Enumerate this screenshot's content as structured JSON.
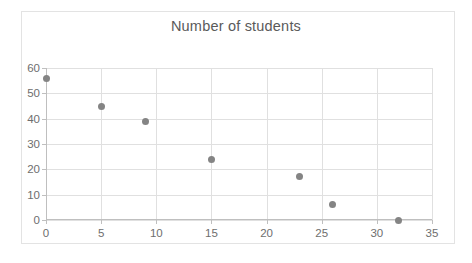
{
  "chart_data": {
    "type": "scatter",
    "title": "Number of students",
    "xlabel": "",
    "ylabel": "",
    "xlim": [
      0,
      35
    ],
    "ylim": [
      0,
      60
    ],
    "xticks": [
      0,
      5,
      10,
      15,
      20,
      25,
      30,
      35
    ],
    "yticks": [
      0,
      10,
      20,
      30,
      40,
      50,
      60
    ],
    "xtick_labels": [
      "0",
      "5",
      "10",
      "15",
      "20",
      "25",
      "30",
      "35"
    ],
    "ytick_labels": [
      "0",
      "10",
      "20",
      "30",
      "40",
      "50",
      "60"
    ],
    "grid": true,
    "legend": false,
    "marker_color": "#848484",
    "gridline_color": "#e0e0e0",
    "axis_color": "#bfbfbf",
    "title_color": "#5a5a5a",
    "tick_label_color": "#6e6e6e",
    "border_color": "#e3e3e3",
    "background_color": "#ffffff",
    "x": [
      0,
      5,
      9,
      15,
      23,
      26,
      32
    ],
    "y": [
      56,
      45,
      39,
      24,
      17,
      6,
      0
    ],
    "points": [
      {
        "x": 0,
        "y": 56
      },
      {
        "x": 5,
        "y": 45
      },
      {
        "x": 9,
        "y": 39
      },
      {
        "x": 15,
        "y": 24
      },
      {
        "x": 23,
        "y": 17
      },
      {
        "x": 26,
        "y": 6
      },
      {
        "x": 32,
        "y": 0
      }
    ]
  }
}
